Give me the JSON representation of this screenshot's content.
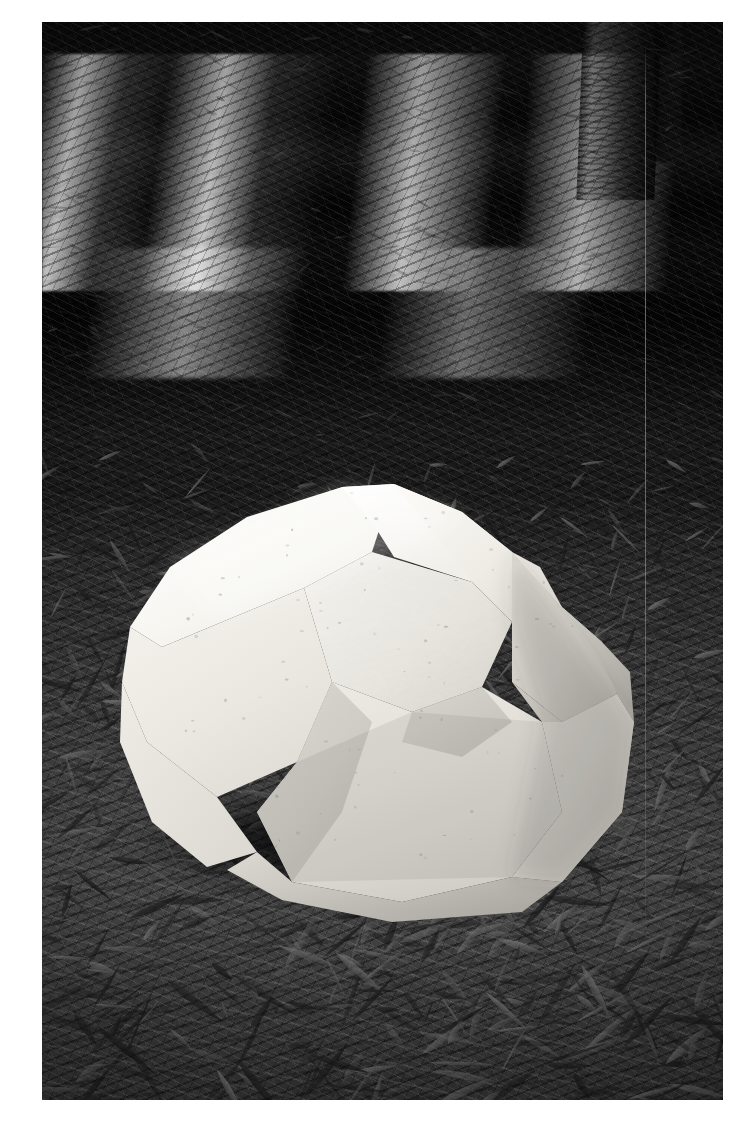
{
  "page": {
    "background_color": "#ffffff",
    "width_px": 751,
    "height_px": 1124,
    "caption": ""
  },
  "photo": {
    "frame": {
      "left_px": 42,
      "top_px": 22,
      "width_px": 681,
      "height_px": 1078
    },
    "type": "photograph",
    "color_mode": "black-and-white",
    "scene_description": "A faceted white stone sculpture resting on a forest floor of fallen eucalyptus leaves, with a tree trunk and dappled sunlight in the background.",
    "border_color": "#ffffff"
  },
  "scene": {
    "subject": {
      "name": "faceted-stone-sculpture",
      "material": "white marble / cast stone",
      "surface": "polygonal faceted planes",
      "highlight_color": "#fafaf7",
      "midtone_color": "#e6e4de",
      "shadow_color": "#b9b7b1",
      "deep_shadow_color": "#9a9893",
      "position": "lower-centre-left of frame"
    },
    "background": {
      "name": "forest-floor",
      "ground_cover": "dry eucalyptus leaf litter",
      "lighting": "dappled sunlight, strong horizontal sunlit bands across the upper third",
      "dark_tone": "#141414",
      "mid_tone": "#3a3a3a",
      "light_tone": "#f2f2f2"
    },
    "tree": {
      "name": "tree-trunk",
      "position": "upper-right",
      "tone": "#2b2b2b"
    },
    "artifact": {
      "name": "vertical-wire-line",
      "description": "thin pale vertical line running down the right side of the frame",
      "tone": "#cdcdcd"
    },
    "cast_shadow": {
      "name": "stone-cast-shadow",
      "direction": "towards lower-left and beneath the stone",
      "tone": "#0c0c0c"
    }
  }
}
